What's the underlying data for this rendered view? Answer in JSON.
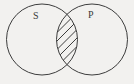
{
  "figure": {
    "type": "venn-diagram",
    "title": "",
    "width": 134,
    "height": 84,
    "background_color": "#f2f1ef",
    "stroke_color": "#3d3d3d",
    "stroke_width": 1,
    "label_color": "#3a3a3a"
  },
  "sets": [
    {
      "id": "s",
      "label": "S",
      "label_x": 36,
      "label_y": 16,
      "center_x": 42,
      "center_y": 39.5,
      "radius": 35.5
    },
    {
      "id": "p",
      "label": "P",
      "label_x": 91,
      "label_y": 15,
      "center_x": 92,
      "center_y": 39.5,
      "radius": 35.5
    }
  ],
  "intersection": {
    "shaded": true,
    "shading_style": "diagonal-hatch",
    "hatch_direction": "lower-left-to-upper-right",
    "hatch_line_count": 9,
    "hatch_spacing": 6,
    "hatch_color": "#3d3d3d",
    "hatch_width": 1,
    "top_crossing_x": 59,
    "top_crossing_y": 15,
    "bottom_crossing_x": 59,
    "bottom_crossing_y": 64,
    "left_extent_x": 56.5,
    "right_extent_x": 77.5
  }
}
